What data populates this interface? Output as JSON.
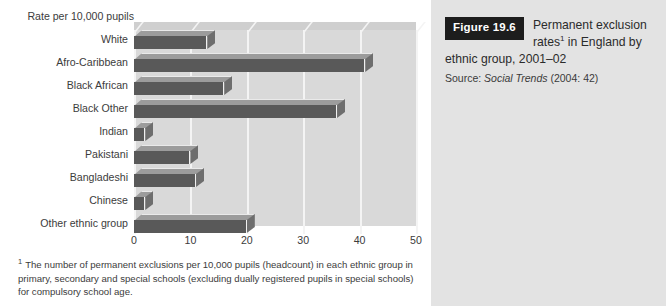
{
  "figure": {
    "badge_label": "Figure 19.6",
    "title_line1": "Permanent exclusion",
    "title_line2_pre": "rates",
    "title_line2_sup": "1",
    "title_line2_post": " in England by",
    "title_line3": "ethnic group, 2001–02",
    "source_prefix": "Source: ",
    "source_italic": "Social Trends",
    "source_suffix": " (2004: 42)"
  },
  "footnote": {
    "marker": "1",
    "text": "The number of permanent exclusions per 10,000 pupils (headcount) in each ethnic group in primary, secondary and special schools (excluding dually registered pupils in special schools) for compulsory school age."
  },
  "colors": {
    "bar_front": "#595959",
    "bar_top": "#9c9c9c",
    "bar_side": "#6e6e6e",
    "plot_background": "#d9d9d9",
    "gridline": "#f4f4f4",
    "panel_background": "#e3e3e3",
    "badge_background": "#1d1d1d",
    "page_background": "#ffffff"
  },
  "chart_data": {
    "type": "bar",
    "orientation": "horizontal",
    "xlabel": "Rate per 10,000 pupils",
    "ylabel": "",
    "axis_title": "Rate per 10,000 pupils",
    "categories": [
      "White",
      "Afro-Caribbean",
      "Black African",
      "Black Other",
      "Indian",
      "Pakistani",
      "Bangladeshi",
      "Chinese",
      "Other ethnic group"
    ],
    "values": [
      13,
      41,
      16,
      36,
      2,
      10,
      11,
      2,
      20
    ],
    "xlim": [
      0,
      50
    ],
    "xticks": [
      0,
      10,
      20,
      30,
      40,
      50
    ],
    "xtick_labels": [
      "0",
      "10",
      "20",
      "30",
      "40",
      "50"
    ],
    "grid": true,
    "legend": false
  }
}
